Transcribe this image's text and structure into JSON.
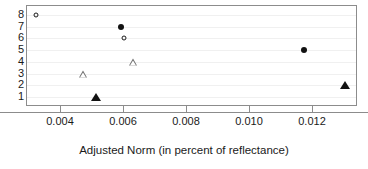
{
  "chart_data": {
    "type": "scatter",
    "title": "",
    "xlabel": "Adjusted Norm (in percent of reflectance)",
    "ylabel": "",
    "xlim": [
      0.0027,
      0.0132
    ],
    "ylim": [
      0.4,
      8.6
    ],
    "grid": true,
    "legend": "none",
    "xticks": [
      {
        "value": 0.004,
        "label": "0.004"
      },
      {
        "value": 0.006,
        "label": "0.006"
      },
      {
        "value": 0.008,
        "label": "0.008"
      },
      {
        "value": 0.01,
        "label": "0.010"
      },
      {
        "value": 0.012,
        "label": "0.012"
      }
    ],
    "yticks": [
      {
        "value": 8,
        "label": "8"
      },
      {
        "value": 7,
        "label": "7"
      },
      {
        "value": 6,
        "label": "6"
      },
      {
        "value": 5,
        "label": "5"
      },
      {
        "value": 4,
        "label": "4"
      },
      {
        "value": 3,
        "label": "3"
      },
      {
        "value": 2,
        "label": "2"
      },
      {
        "value": 1,
        "label": "1"
      }
    ],
    "points": [
      {
        "x": 0.0032,
        "y": 8,
        "marker": "circle-open"
      },
      {
        "x": 0.0059,
        "y": 7,
        "marker": "circle-filled"
      },
      {
        "x": 0.006,
        "y": 6,
        "marker": "circle-open"
      },
      {
        "x": 0.0117,
        "y": 5,
        "marker": "circle-filled"
      },
      {
        "x": 0.0063,
        "y": 4,
        "marker": "triangle-open"
      },
      {
        "x": 0.0047,
        "y": 3,
        "marker": "triangle-open"
      },
      {
        "x": 0.013,
        "y": 2,
        "marker": "triangle-filled"
      },
      {
        "x": 0.0051,
        "y": 1,
        "marker": "triangle-filled"
      }
    ],
    "colors": {
      "marker_fill": "#121212",
      "marker_outline": "#1a1a1a",
      "triangle_outline": "#6e6e6e",
      "axis": "#8c8c8c",
      "grid": "#f0f0f0",
      "text": "#1a1a1a",
      "background": "#ffffff"
    }
  }
}
